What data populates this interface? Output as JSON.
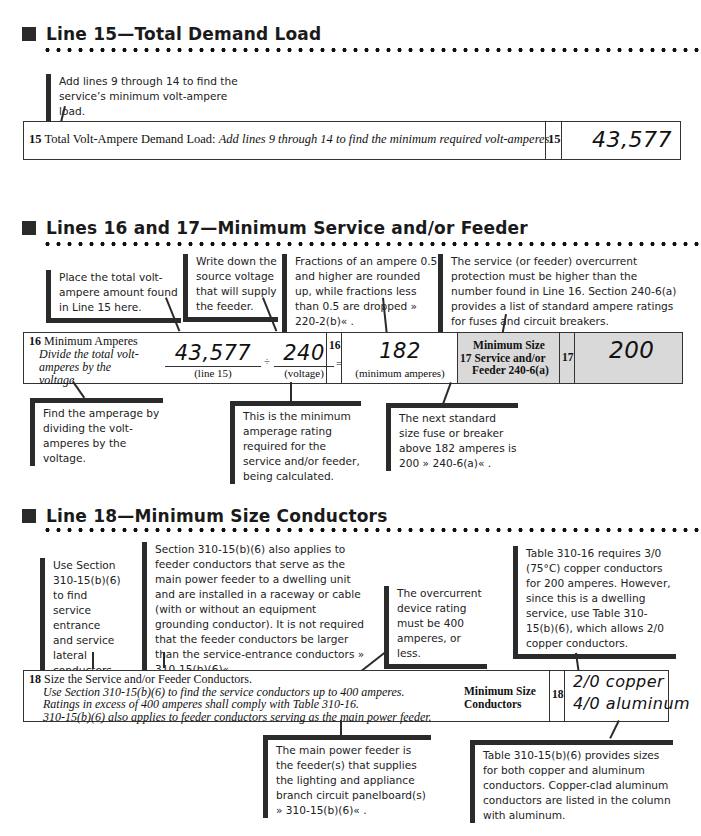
{
  "sections": [
    {
      "title": "Line 15—Total Demand Load"
    },
    {
      "title": "Lines 16 and 17—Minimum Service and/or Feeder"
    },
    {
      "title": "Line 18—Minimum Size Conductors"
    }
  ],
  "line15": {
    "note": "Add lines 9 through 14 to find the service’s minimum volt-ampere load.",
    "number": "15",
    "label": "Total Volt-Ampere Demand Load:",
    "instruction": "Add lines 9 through 14 to find the minimum required volt-amperes.",
    "box_number": "15",
    "value": "43,577"
  },
  "line16": {
    "notes_top": [
      "Place the total volt-ampere amount found in Line 15 here.",
      "Write down the source voltage that will supply the feeder.",
      "Fractions of an ampere 0.5 and higher are rounded up, while fractions less than 0.5 are dropped » 220-2(b)« ."
    ],
    "number": "16",
    "label": "Minimum Amperes",
    "instruction": "Divide the total volt-amperes by the voltage",
    "va_value": "43,577",
    "va_caption": "(line 15)",
    "divide_sign": "÷",
    "voltage_value": "240",
    "voltage_caption": "(voltage)",
    "equals_sign": "=",
    "box_number": "16",
    "amps_value": "182",
    "amps_caption": "(minimum amperes)",
    "notes_bottom": [
      "Find the amperage by dividing the volt-amperes by the voltage.",
      "This is the minimum amperage rating required for the service and/or feeder, being calculated."
    ]
  },
  "line17": {
    "note_top": "The service (or feeder) overcurrent protection must be higher than the number found in Line 16. Section 240-6(a) provides a list of standard ampere ratings for fuses and circuit breakers.",
    "label_line1": "Minimum Size",
    "label_line2": "17 Service and/or",
    "label_line3": "Feeder 240-6(a)",
    "box_number": "17",
    "value": "200",
    "note_bottom": "The next standard size fuse or breaker above 182 amperes is 200 » 240-6(a)« ."
  },
  "line18": {
    "notes_top": [
      "Use Section 310-15(b)(6) to find service entrance and service lateral conductors.",
      "Section 310-15(b)(6) also applies to feeder conductors that serve as the main power feeder to a dwelling unit and are installed in a raceway or cable (with or without an equipment grounding conductor). It is not required that the feeder conductors be larger than the service-entrance conductors » 310-15(b)(6)« .",
      "The overcurrent device rating must be 400 amperes, or less.",
      "Table 310-16 requires 3/0 (75°C) copper conductors for 200 amperes. However, since this is a dwelling service, use Table 310-15(b)(6), which allows 2/0 copper conductors."
    ],
    "number": "18",
    "label": "Size the Service and/or Feeder Conductors.",
    "instructions": [
      "Use Section 310-15(b)(6) to find the service conductors up to 400 amperes.",
      "Ratings in excess of 400 amperes shall comply with Table 310-16.",
      "310-15(b)(6) also applies to feeder conductors serving as the main power feeder."
    ],
    "right_label_line1": "Minimum Size",
    "right_label_line2": "Conductors",
    "box_number": "18",
    "value_copper": "2/0 copper",
    "value_aluminum": "4/0 aluminum",
    "notes_bottom": [
      "The main power feeder is the feeder(s) that supplies the lighting and appliance branch circuit panelboard(s) » 310-15(b)(6)« .",
      "Table 310-15(b)(6) provides sizes for both copper and aluminum conductors. Copper-clad aluminum conductors are listed in the column with aluminum."
    ]
  }
}
